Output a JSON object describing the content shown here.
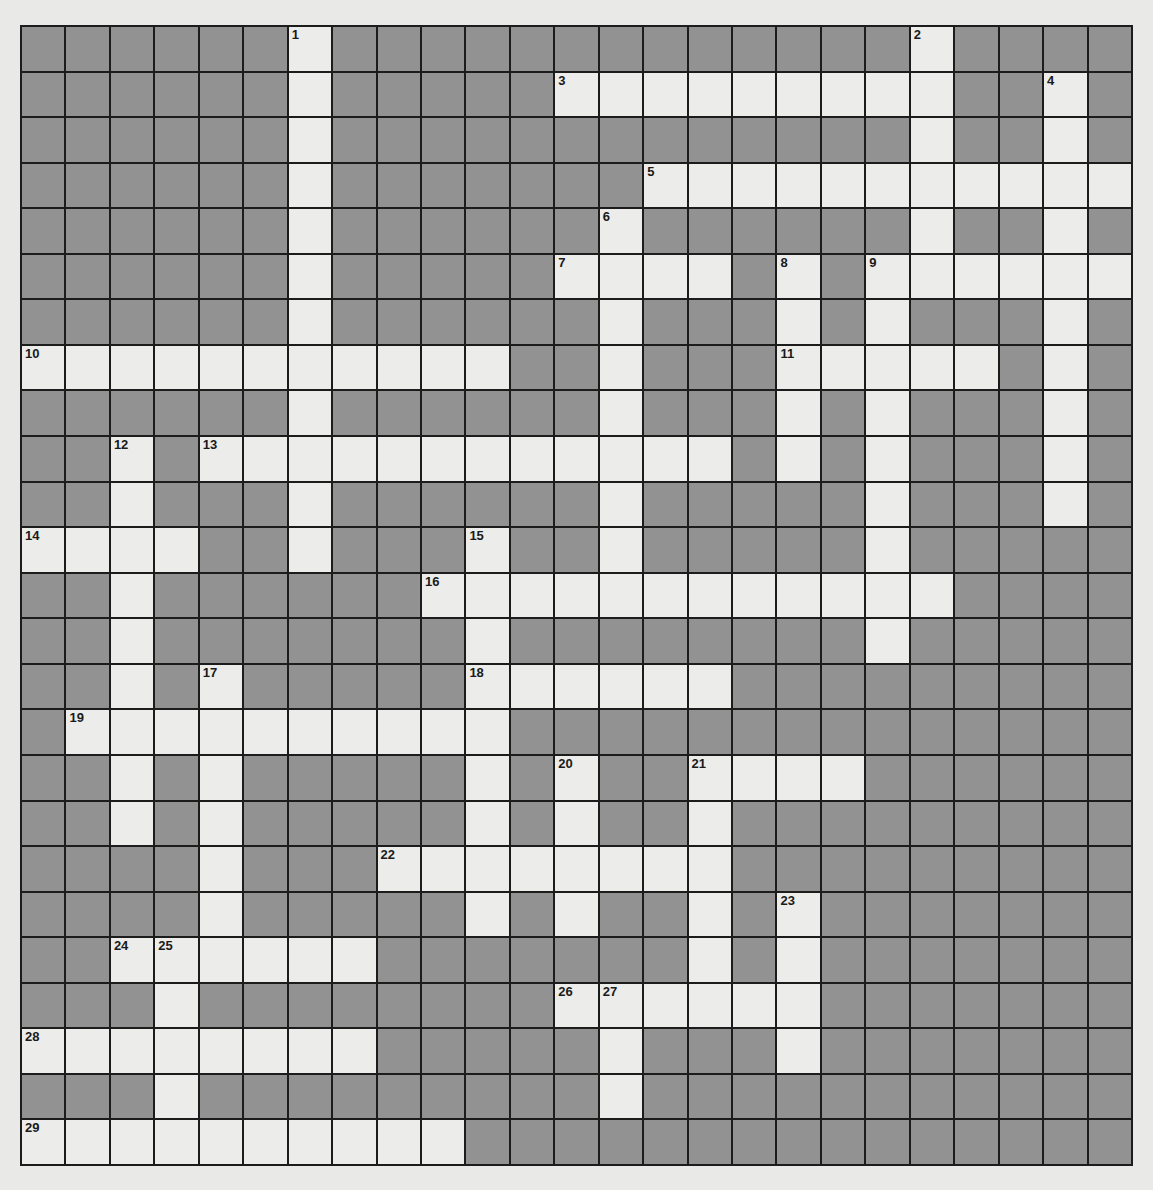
{
  "puzzle": {
    "rows": 25,
    "cols": 25,
    "colors": {
      "block": "#929292",
      "open": "#ececea",
      "grid_line": "#1c1c1c",
      "page_background": "#e9e9e7",
      "number_text": "#1a1a1a"
    },
    "legend": {
      "#": "block (shaded, not part of any answer)",
      ".": "open (white, empty answer square)"
    },
    "grid": [
      "######.#############.####",
      "######.#####.........##.#",
      "######.#############.##.#",
      "######.#######...........",
      "######.######.######.##.#",
      "######.#####....#.#......",
      "######.######.###.#.###.#",
      "...........##.###.....#.#",
      "######.######.###.#.###.#",
      "##.#............#.#.###.#",
      "##.###.######.#####.###.#",
      "....##.###.##.#####.#####",
      "##.######............####",
      "##.#######.########.#####",
      "##.#.#####......#########",
      "#..........##############",
      "##.#.#####.#.##....######",
      "##.#.#####.#.##.#########",
      "####.###........#########",
      "####.#####.#.##.#.#######",
      "##......#######.#.#######",
      "###.########......#######",
      "........#####.###.#######",
      "###.#########.###########",
      "..........###############"
    ],
    "numbers": [
      {
        "n": "1",
        "row": 0,
        "col": 6
      },
      {
        "n": "2",
        "row": 0,
        "col": 20
      },
      {
        "n": "3",
        "row": 1,
        "col": 12
      },
      {
        "n": "4",
        "row": 1,
        "col": 23
      },
      {
        "n": "5",
        "row": 3,
        "col": 14
      },
      {
        "n": "6",
        "row": 4,
        "col": 13
      },
      {
        "n": "7",
        "row": 5,
        "col": 12
      },
      {
        "n": "8",
        "row": 5,
        "col": 17
      },
      {
        "n": "9",
        "row": 5,
        "col": 19
      },
      {
        "n": "10",
        "row": 7,
        "col": 0
      },
      {
        "n": "11",
        "row": 7,
        "col": 17
      },
      {
        "n": "12",
        "row": 9,
        "col": 2
      },
      {
        "n": "13",
        "row": 9,
        "col": 4
      },
      {
        "n": "14",
        "row": 11,
        "col": 0
      },
      {
        "n": "15",
        "row": 11,
        "col": 10
      },
      {
        "n": "16",
        "row": 12,
        "col": 9
      },
      {
        "n": "17",
        "row": 14,
        "col": 4
      },
      {
        "n": "18",
        "row": 14,
        "col": 10
      },
      {
        "n": "19",
        "row": 15,
        "col": 1
      },
      {
        "n": "20",
        "row": 16,
        "col": 12
      },
      {
        "n": "21",
        "row": 16,
        "col": 15
      },
      {
        "n": "22",
        "row": 18,
        "col": 8
      },
      {
        "n": "23",
        "row": 19,
        "col": 17
      },
      {
        "n": "24",
        "row": 20,
        "col": 2
      },
      {
        "n": "25",
        "row": 20,
        "col": 3
      },
      {
        "n": "26",
        "row": 21,
        "col": 12
      },
      {
        "n": "27",
        "row": 21,
        "col": 13
      },
      {
        "n": "28",
        "row": 22,
        "col": 0
      },
      {
        "n": "29",
        "row": 24,
        "col": 0
      }
    ],
    "entries": {
      "across": [
        {
          "n": "3",
          "row": 1,
          "col": 12,
          "length": 9
        },
        {
          "n": "5",
          "row": 3,
          "col": 14,
          "length": 11
        },
        {
          "n": "7",
          "row": 5,
          "col": 12,
          "length": 4
        },
        {
          "n": "9",
          "row": 5,
          "col": 19,
          "length": 6
        },
        {
          "n": "10",
          "row": 7,
          "col": 0,
          "length": 11
        },
        {
          "n": "11",
          "row": 7,
          "col": 17,
          "length": 5
        },
        {
          "n": "13",
          "row": 9,
          "col": 4,
          "length": 12
        },
        {
          "n": "14",
          "row": 11,
          "col": 0,
          "length": 4
        },
        {
          "n": "16",
          "row": 12,
          "col": 9,
          "length": 12
        },
        {
          "n": "18",
          "row": 14,
          "col": 10,
          "length": 6
        },
        {
          "n": "19",
          "row": 15,
          "col": 1,
          "length": 10
        },
        {
          "n": "21",
          "row": 16,
          "col": 15,
          "length": 4
        },
        {
          "n": "22",
          "row": 18,
          "col": 8,
          "length": 8
        },
        {
          "n": "24",
          "row": 20,
          "col": 2,
          "length": 6
        },
        {
          "n": "26",
          "row": 21,
          "col": 12,
          "length": 6
        },
        {
          "n": "28",
          "row": 22,
          "col": 0,
          "length": 8
        },
        {
          "n": "29",
          "row": 24,
          "col": 0,
          "length": 10
        }
      ],
      "down": [
        {
          "n": "1",
          "row": 0,
          "col": 6,
          "length": 12
        },
        {
          "n": "2",
          "row": 0,
          "col": 20,
          "length": 6
        },
        {
          "n": "4",
          "row": 1,
          "col": 23,
          "length": 10
        },
        {
          "n": "6",
          "row": 4,
          "col": 13,
          "length": 9
        },
        {
          "n": "8",
          "row": 5,
          "col": 17,
          "length": 5
        },
        {
          "n": "9",
          "row": 5,
          "col": 19,
          "length": 9
        },
        {
          "n": "12",
          "row": 9,
          "col": 2,
          "length": 9
        },
        {
          "n": "15",
          "row": 11,
          "col": 10,
          "length": 9
        },
        {
          "n": "17",
          "row": 14,
          "col": 4,
          "length": 7
        },
        {
          "n": "20",
          "row": 16,
          "col": 12,
          "length": 4
        },
        {
          "n": "21",
          "row": 16,
          "col": 15,
          "length": 6
        },
        {
          "n": "23",
          "row": 19,
          "col": 17,
          "length": 4
        },
        {
          "n": "25",
          "row": 20,
          "col": 3,
          "length": 5
        },
        {
          "n": "27",
          "row": 21,
          "col": 13,
          "length": 3
        }
      ]
    },
    "filled_letters": []
  }
}
